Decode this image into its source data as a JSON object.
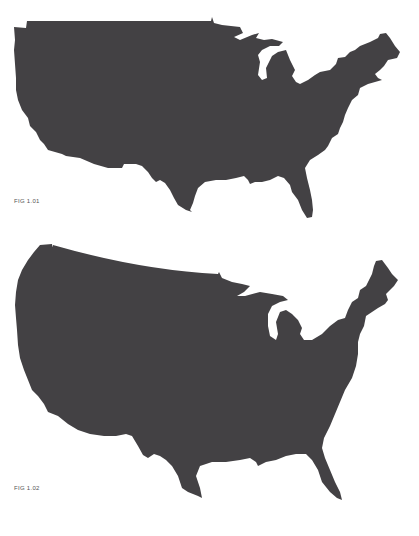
{
  "figures": [
    {
      "caption": "FIG 1.01",
      "subject": "contiguous-united-states-silhouette",
      "fill_color": "#434144"
    },
    {
      "caption": "FIG 1.02",
      "subject": "contiguous-united-states-silhouette",
      "fill_color": "#434144"
    }
  ],
  "background_color": "#ffffff"
}
